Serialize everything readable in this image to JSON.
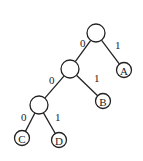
{
  "diagram": {
    "type": "binary-tree",
    "nodes": [
      {
        "id": "root",
        "label": "",
        "x": 96,
        "y": 33,
        "r": 9
      },
      {
        "id": "n1",
        "label": "",
        "x": 70,
        "y": 69,
        "r": 9
      },
      {
        "id": "A",
        "label": "A",
        "x": 124,
        "y": 70,
        "r": 7.5
      },
      {
        "id": "n2",
        "label": "",
        "x": 39,
        "y": 105,
        "r": 9
      },
      {
        "id": "B",
        "label": "B",
        "x": 103,
        "y": 101,
        "r": 7.5
      },
      {
        "id": "C",
        "label": "C",
        "x": 22,
        "y": 138,
        "r": 7.5
      },
      {
        "id": "D",
        "label": "D",
        "x": 59,
        "y": 140,
        "r": 7.5
      }
    ],
    "edges": [
      {
        "from": "root",
        "to": "n1",
        "label": "0",
        "lx": 80,
        "ly": 47
      },
      {
        "from": "root",
        "to": "A",
        "label": "1",
        "lx": 115,
        "ly": 49
      },
      {
        "from": "n1",
        "to": "n2",
        "label": "0",
        "lx": 49,
        "ly": 84
      },
      {
        "from": "n1",
        "to": "B",
        "label": "1",
        "lx": 94,
        "ly": 82
      },
      {
        "from": "n2",
        "to": "C",
        "label": "0",
        "lx": 21,
        "ly": 121
      },
      {
        "from": "n2",
        "to": "D",
        "label": "1",
        "lx": 55,
        "ly": 121
      }
    ]
  }
}
